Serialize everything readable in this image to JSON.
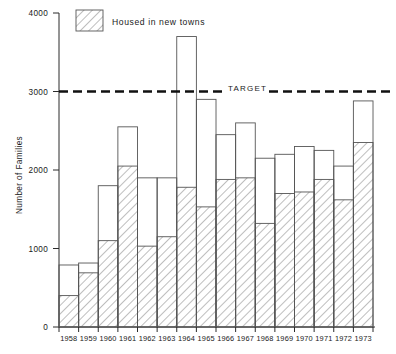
{
  "chart_data": {
    "type": "bar",
    "title": "",
    "subtitle": "",
    "xlabel": "",
    "ylabel": "Number of Families",
    "categories": [
      "1958",
      "1959",
      "1960",
      "1961",
      "1962",
      "1963",
      "1964",
      "1965",
      "1966",
      "1967",
      "1968",
      "1969",
      "1970",
      "1971",
      "1972",
      "1973"
    ],
    "series": [
      {
        "name": "Housed in new towns",
        "values": [
          400,
          690,
          1100,
          2050,
          1030,
          1150,
          1780,
          1530,
          1880,
          1900,
          1320,
          1700,
          1720,
          1880,
          1620,
          2350
        ]
      },
      {
        "name": "Total housed",
        "values": [
          790,
          815,
          1800,
          2550,
          1900,
          1900,
          3700,
          2900,
          2450,
          2600,
          2150,
          2200,
          2300,
          2250,
          2050,
          2880
        ]
      }
    ],
    "ylim": [
      0,
      4000
    ],
    "yticks": [
      0,
      1000,
      2000,
      3000,
      4000
    ],
    "ytick_labels": [
      "0",
      "1000",
      "2000",
      "3000",
      "4000"
    ],
    "grid": false,
    "legend_position": "top-left",
    "annotations": [
      {
        "name": "target",
        "label": "TARGET",
        "value": 3000,
        "style": "dashed-horizontal-line"
      }
    ]
  },
  "legend": {
    "entries": [
      {
        "label": "Housed in new towns",
        "pattern": "diagonal-hatch"
      }
    ]
  },
  "axes": {
    "y_title": "Number of Families",
    "y_tick_labels": [
      "4000",
      "3000",
      "2000",
      "1000",
      "0"
    ],
    "x_tick_labels": [
      "1958",
      "1959",
      "1960",
      "1961",
      "1962",
      "1963",
      "1964",
      "1965",
      "1966",
      "1967",
      "1968",
      "1969",
      "1970",
      "1971",
      "1972",
      "1973"
    ]
  },
  "target": {
    "label": "TARGET"
  },
  "colors": {
    "axis": "#2b2b2b",
    "bar_stroke": "#555555",
    "hatch": "#555555",
    "target_line": "#111111",
    "background": "#ffffff"
  }
}
